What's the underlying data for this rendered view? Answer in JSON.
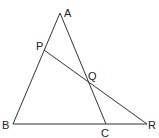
{
  "diagram": {
    "type": "geometry",
    "points": {
      "A": {
        "label": "A",
        "x": 60,
        "y": 13,
        "lx": 64,
        "ly": 17
      },
      "B": {
        "label": "B",
        "x": 13,
        "y": 124,
        "lx": 2,
        "ly": 129
      },
      "C": {
        "label": "C",
        "x": 106,
        "y": 124,
        "lx": 101,
        "ly": 137
      },
      "R": {
        "label": "R",
        "x": 147,
        "y": 124,
        "lx": 148,
        "ly": 129
      },
      "P": {
        "label": "P",
        "x": 44,
        "y": 50,
        "lx": 36,
        "ly": 50
      },
      "Q": {
        "label": "Q",
        "x": 89,
        "y": 82,
        "lx": 88,
        "ly": 80
      }
    },
    "segments": [
      [
        "A",
        "B"
      ],
      [
        "A",
        "C"
      ],
      [
        "B",
        "R"
      ],
      [
        "P",
        "R"
      ]
    ],
    "stroke_color": "#333333"
  }
}
